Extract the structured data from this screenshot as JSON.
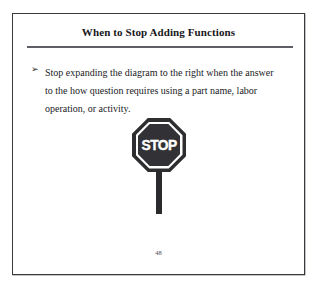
{
  "slide": {
    "title": "When to Stop Adding Functions",
    "bullet": {
      "marker": "➢",
      "text": "Stop expanding the diagram to the right when the answer to the how question requires using a part name, labor operation, or activity."
    },
    "figure": {
      "sign_word": "STOP",
      "sign_color": "#2e2e31",
      "sign_face_color": "#323236",
      "sign_ring_color": "#ffffff",
      "post_color": "#2b2b2e"
    },
    "page_number": "48",
    "rule_color": "#5e5e66",
    "border_color": "#3a3a3e",
    "text_color": "#1a1a1e",
    "background": "#ffffff"
  }
}
